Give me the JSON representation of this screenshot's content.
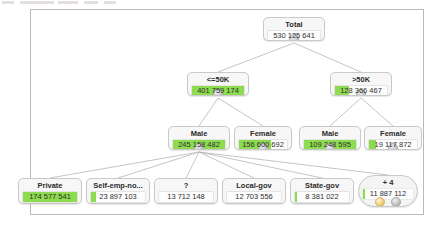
{
  "panel": {
    "name": "decision-tree-panel"
  },
  "top_strip": {
    "segments": 5
  },
  "tree": {
    "root": {
      "id": "total",
      "title": "Total",
      "value": "530 125 641",
      "bar_pct": 0,
      "shape": "rect",
      "expandable": true,
      "x": 263,
      "y": 17,
      "w": 62,
      "h": 24
    },
    "level2": [
      {
        "id": "lte50k",
        "title": "<=50K",
        "value": "401 759 174",
        "bar_pct": 100,
        "shape": "rect",
        "expandable": true,
        "x": 187,
        "y": 72,
        "w": 62,
        "h": 24
      },
      {
        "id": "gt50k",
        "title": ">50K",
        "value": "128 366 467",
        "bar_pct": 26,
        "shape": "rect",
        "expandable": true,
        "x": 330,
        "y": 72,
        "w": 62,
        "h": 24
      }
    ],
    "level3": [
      {
        "id": "lte50k-male",
        "title": "Male",
        "value": "245 158 482",
        "bar_pct": 100,
        "shape": "rect",
        "expandable": true,
        "x": 168,
        "y": 126,
        "w": 62,
        "h": 24
      },
      {
        "id": "lte50k-female",
        "title": "Female",
        "value": "156 600 692",
        "bar_pct": 66,
        "shape": "rect",
        "expandable": true,
        "x": 234,
        "y": 126,
        "w": 58,
        "h": 24
      },
      {
        "id": "gt50k-male",
        "title": "Male",
        "value": "109 248 595",
        "bar_pct": 100,
        "shape": "rect",
        "expandable": true,
        "x": 299,
        "y": 126,
        "w": 62,
        "h": 24
      },
      {
        "id": "gt50k-female",
        "title": "Female",
        "value": "19 117 872",
        "bar_pct": 14,
        "shape": "rect",
        "expandable": true,
        "x": 364,
        "y": 126,
        "w": 58,
        "h": 24
      }
    ],
    "level4": [
      {
        "id": "private",
        "title": "Private",
        "value": "174 577 541",
        "bar_pct": 100,
        "shape": "rect",
        "expandable": false,
        "x": 18,
        "y": 178,
        "w": 64,
        "h": 26
      },
      {
        "id": "self-emp-not-inc",
        "title": "Self-emp-no...",
        "value": "23 897 103",
        "bar_pct": 10,
        "shape": "rect",
        "expandable": false,
        "x": 86,
        "y": 178,
        "w": 64,
        "h": 26
      },
      {
        "id": "unknown",
        "title": "?",
        "value": "13 712 148",
        "bar_pct": 0,
        "shape": "rect",
        "expandable": false,
        "x": 154,
        "y": 178,
        "w": 64,
        "h": 26
      },
      {
        "id": "local-gov",
        "title": "Local-gov",
        "value": "12 703 556",
        "bar_pct": 0,
        "shape": "rect",
        "expandable": false,
        "x": 222,
        "y": 178,
        "w": 64,
        "h": 26
      },
      {
        "id": "state-gov",
        "title": "State-gov",
        "value": "8 381 022",
        "bar_pct": 4,
        "shape": "rect",
        "expandable": false,
        "x": 290,
        "y": 178,
        "w": 64,
        "h": 26
      },
      {
        "id": "plus-4",
        "title": "+ 4",
        "value": "11 887 112",
        "bar_pct": 4,
        "shape": "pill",
        "expandable": false,
        "x": 358,
        "y": 175,
        "w": 60,
        "h": 32,
        "icons": [
          "document-icon",
          "gear-icon"
        ]
      }
    ],
    "edges": [
      {
        "from": "total",
        "to": "lte50k"
      },
      {
        "from": "total",
        "to": "gt50k"
      },
      {
        "from": "lte50k",
        "to": "lte50k-male"
      },
      {
        "from": "lte50k",
        "to": "lte50k-female"
      },
      {
        "from": "gt50k",
        "to": "gt50k-male"
      },
      {
        "from": "gt50k",
        "to": "gt50k-female"
      },
      {
        "from": "lte50k-male",
        "to": "private"
      },
      {
        "from": "lte50k-male",
        "to": "self-emp-not-inc"
      },
      {
        "from": "lte50k-male",
        "to": "unknown"
      },
      {
        "from": "lte50k-male",
        "to": "local-gov"
      },
      {
        "from": "lte50k-male",
        "to": "state-gov"
      },
      {
        "from": "lte50k-male",
        "to": "plus-4"
      }
    ]
  },
  "colors": {
    "bar_green": "#8ddb4e",
    "node_bg": "#f7f7f7",
    "node_border": "#c9c9c9",
    "edge": "#b5b5b5",
    "panel_border": "#b9b9b9"
  }
}
